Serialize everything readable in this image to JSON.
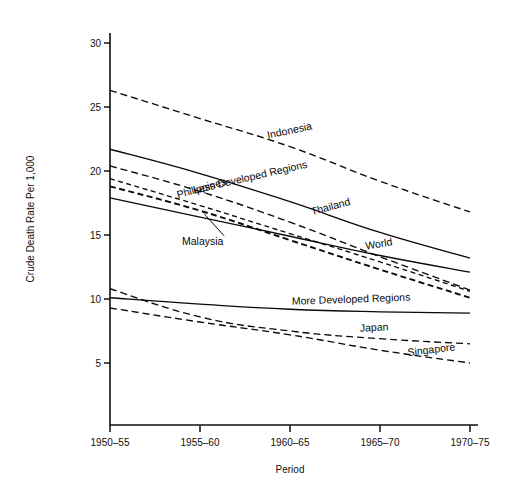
{
  "chart_data": {
    "type": "line",
    "title": "",
    "xlabel": "Period",
    "ylabel": "Crude Death Rate Per 1,000",
    "categories": [
      "1950-55",
      "1955-60",
      "1960-65",
      "1965-70",
      "1970-75"
    ],
    "x_tick_labels": [
      "1950–55",
      "1955–60",
      "1960–65",
      "1965–70",
      "1970–75"
    ],
    "y_tick_labels": [
      "5",
      "10",
      "15",
      "20",
      "25",
      "30"
    ],
    "y_ticks": [
      5,
      10,
      15,
      20,
      25,
      30
    ],
    "ylim": [
      0,
      31
    ],
    "grid": false,
    "legend": "inline-labels",
    "series": [
      {
        "name": "Indonesia",
        "label": "Indonesia",
        "style": "dashed",
        "values": [
          26.3,
          24.1,
          21.9,
          19.2,
          16.8
        ],
        "label_at": 2,
        "label_rotation": -12
      },
      {
        "name": "Less Developed Regions",
        "label": "Less Developed Regions",
        "style": "solid",
        "values": [
          21.7,
          19.8,
          17.6,
          15.2,
          13.2
        ],
        "label_at": 2,
        "label_rotation": -13
      },
      {
        "name": "Thailand",
        "label": "Thailand",
        "style": "dashed",
        "values": [
          20.4,
          18.4,
          16.0,
          13.3,
          10.7
        ],
        "label_at": 2,
        "label_rotation": -15
      },
      {
        "name": "Philippines",
        "label": "Philippines",
        "style": "dashed-tight",
        "values": [
          19.4,
          17.3,
          15.1,
          12.9,
          10.6
        ],
        "label_at": 1,
        "label_rotation": -16
      },
      {
        "name": "Malaysia",
        "label": "Malaysia",
        "style": "heavy-dash",
        "values": [
          18.8,
          16.9,
          14.6,
          12.3,
          10.1
        ],
        "label_at": 1,
        "label_rotation": 0,
        "has_leader": true
      },
      {
        "name": "World",
        "label": "World",
        "style": "solid",
        "values": [
          17.9,
          16.4,
          14.9,
          13.4,
          12.1
        ],
        "label_at": 3,
        "label_rotation": -9
      },
      {
        "name": "More Developed Regions",
        "label": "More Developed Regions",
        "style": "solid",
        "values": [
          10.1,
          9.6,
          9.2,
          9.0,
          8.9
        ],
        "label_at": 3,
        "label_rotation": -2
      },
      {
        "name": "Japan",
        "label": "Japan",
        "style": "dashed",
        "values": [
          10.8,
          8.6,
          7.5,
          6.9,
          6.5
        ],
        "label_at": 3,
        "label_rotation": -3
      },
      {
        "name": "Singapore",
        "label": "Singapore",
        "style": "dashed",
        "values": [
          9.3,
          8.2,
          7.2,
          6.0,
          5.0
        ],
        "label_at": 4,
        "label_rotation": -7
      }
    ]
  }
}
